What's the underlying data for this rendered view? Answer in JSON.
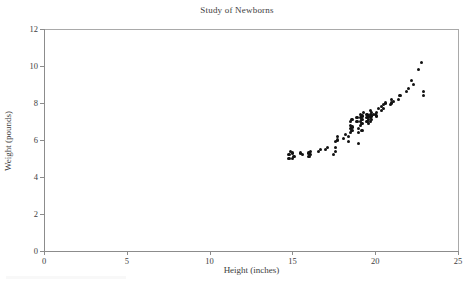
{
  "chart_data": {
    "type": "scatter",
    "title": "Study of Newborns",
    "xlabel": "Height (inches)",
    "ylabel": "Weight (pounds)",
    "xlim": [
      0,
      25
    ],
    "ylim": [
      0,
      12
    ],
    "xticks": [
      0,
      5,
      10,
      15,
      20,
      25
    ],
    "yticks": [
      0,
      2,
      4,
      6,
      8,
      10,
      12
    ],
    "grid": false,
    "legend": null,
    "marker": "filled-circle",
    "marker_color": "#121212",
    "series": [
      {
        "name": "newborns",
        "x": [
          14.8,
          14.8,
          14.9,
          15.0,
          15.0,
          15.1,
          15.5,
          15.6,
          16.0,
          16.0,
          16.1,
          16.1,
          16.6,
          16.7,
          17.0,
          17.1,
          17.5,
          17.6,
          17.6,
          17.6,
          17.7,
          17.7,
          18.1,
          18.2,
          18.4,
          18.4,
          18.5,
          18.5,
          18.5,
          18.5,
          18.6,
          18.6,
          18.6,
          18.9,
          18.9,
          19.0,
          19.0,
          19.0,
          19.1,
          19.1,
          19.1,
          19.1,
          19.2,
          19.2,
          19.2,
          19.2,
          19.3,
          19.5,
          19.5,
          19.5,
          19.6,
          19.6,
          19.6,
          19.7,
          19.7,
          19.7,
          19.7,
          19.8,
          19.8,
          19.8,
          19.9,
          20.0,
          20.1,
          20.1,
          20.2,
          20.4,
          20.4,
          20.5,
          20.5,
          20.6,
          20.9,
          21.0,
          21.0,
          21.1,
          21.4,
          21.5,
          21.9,
          22.0,
          22.2,
          22.3,
          22.6,
          22.8,
          22.9,
          22.9
        ],
        "y": [
          5.0,
          5.2,
          5.4,
          5.0,
          5.3,
          5.1,
          5.3,
          5.2,
          5.1,
          5.3,
          5.2,
          5.4,
          5.4,
          5.5,
          5.5,
          5.6,
          5.2,
          5.4,
          5.6,
          5.9,
          6.0,
          6.2,
          6.1,
          6.3,
          5.9,
          6.2,
          6.4,
          6.6,
          6.8,
          7.0,
          6.5,
          6.7,
          7.1,
          7.0,
          7.2,
          5.8,
          6.4,
          6.6,
          6.8,
          7.0,
          7.2,
          7.4,
          6.5,
          6.9,
          7.1,
          7.3,
          7.5,
          7.0,
          7.2,
          7.4,
          6.9,
          7.1,
          7.3,
          7.0,
          7.2,
          7.4,
          7.6,
          7.1,
          7.3,
          7.5,
          7.4,
          7.4,
          7.3,
          7.5,
          7.7,
          7.6,
          7.8,
          7.7,
          7.9,
          8.0,
          7.9,
          8.0,
          8.2,
          8.1,
          8.2,
          8.4,
          8.6,
          8.8,
          9.2,
          9.0,
          9.8,
          10.2,
          8.4,
          8.6
        ]
      }
    ]
  }
}
